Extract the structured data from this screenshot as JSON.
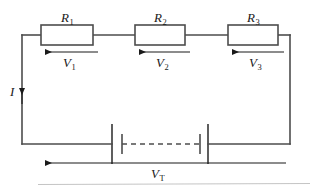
{
  "figure": {
    "kind": "series-circuit-schematic",
    "colors": {
      "wire": "#4d4d4d",
      "resistor_outline": "#4d4d4d",
      "resistor_fill": "#ffffff",
      "label_text": "#1a1a1a",
      "arrow": "#1a1a1a",
      "background": "#ffffff",
      "footer_rule": "#bdbdbd"
    }
  },
  "resistors": [
    {
      "id": "r1",
      "label": "R",
      "subscript": "1"
    },
    {
      "id": "r2",
      "label": "R",
      "subscript": "2"
    },
    {
      "id": "r3",
      "label": "R",
      "subscript": "3"
    }
  ],
  "voltage_drops": [
    {
      "id": "v1",
      "label": "V",
      "subscript": "1",
      "arrow_direction": "left"
    },
    {
      "id": "v2",
      "label": "V",
      "subscript": "2",
      "arrow_direction": "left"
    },
    {
      "id": "v3",
      "label": "V",
      "subscript": "3",
      "arrow_direction": "left"
    }
  ],
  "current": {
    "id": "i",
    "label": "I",
    "subscript": "",
    "arrow_direction": "up"
  },
  "total_voltage": {
    "id": "vt",
    "label": "V",
    "subscript": "T",
    "arrow_direction": "left"
  },
  "battery": {
    "cells": 2,
    "continuation": "dashed",
    "note": "two cell symbols joined by a dashed line"
  }
}
